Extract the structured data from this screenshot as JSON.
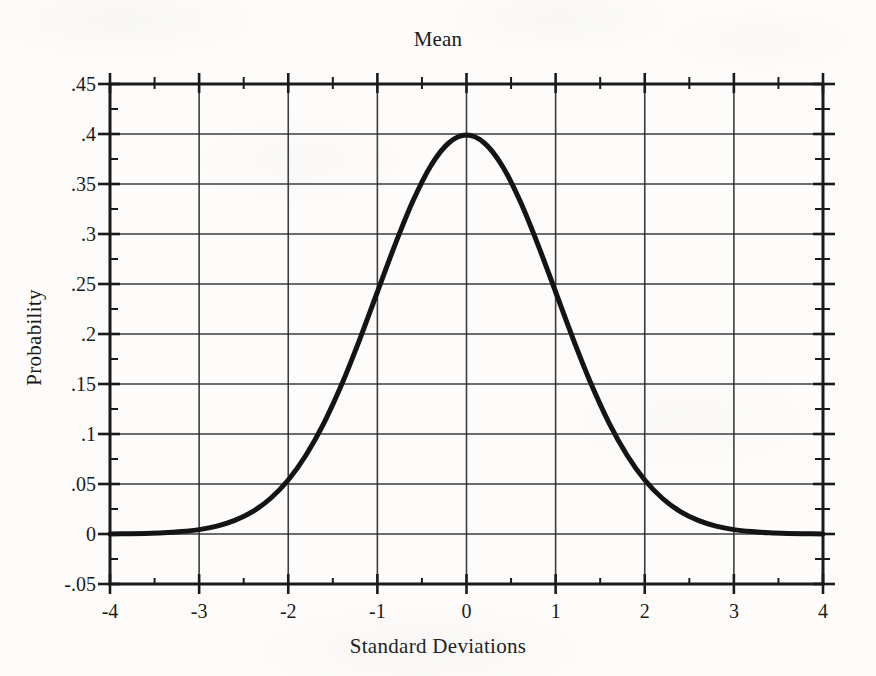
{
  "figure": {
    "background_color": "#fdfcfa",
    "ink_color": "#1a1a1a"
  },
  "chart_data": {
    "type": "line",
    "title": "Mean",
    "subtitle": "",
    "xlabel": "Standard Deviations",
    "ylabel": "Probability",
    "xlim": [
      -4,
      4
    ],
    "ylim": [
      -0.05,
      0.45
    ],
    "grid": true,
    "legend": null,
    "legend_position": "none",
    "x_major_ticks": [
      -4,
      -3,
      -2,
      -1,
      0,
      1,
      2,
      3,
      4
    ],
    "x_tick_labels": [
      "-4",
      "-3",
      "-2",
      "-1",
      "0",
      "1",
      "2",
      "3",
      "4"
    ],
    "x_minor_tick_step": 0.5,
    "y_major_ticks": [
      -0.05,
      0,
      0.05,
      0.1,
      0.15,
      0.2,
      0.25,
      0.3,
      0.35,
      0.4,
      0.45
    ],
    "y_tick_labels": [
      "-.05",
      "0",
      ".05",
      ".1",
      ".15",
      ".2",
      ".25",
      ".3",
      ".35",
      ".4",
      ".45"
    ],
    "y_minor_tick_step": 0.025,
    "series": [
      {
        "name": "Standard Normal Probability Density",
        "color": "#141414",
        "line_width": 5,
        "x": [
          -4,
          -3.8,
          -3.6,
          -3.4,
          -3.2,
          -3,
          -2.8,
          -2.6,
          -2.4,
          -2.2,
          -2,
          -1.8,
          -1.6,
          -1.4,
          -1.2,
          -1,
          -0.8,
          -0.6,
          -0.4,
          -0.2,
          0,
          0.2,
          0.4,
          0.6,
          0.8,
          1,
          1.2,
          1.4,
          1.6,
          1.8,
          2,
          2.2,
          2.4,
          2.6,
          2.8,
          3,
          3.2,
          3.4,
          3.6,
          3.8,
          4
        ],
        "y": [
          0.0001,
          0.0003,
          0.0006,
          0.0012,
          0.0024,
          0.0044,
          0.0079,
          0.0136,
          0.0224,
          0.0355,
          0.054,
          0.079,
          0.1109,
          0.1497,
          0.1942,
          0.242,
          0.2897,
          0.3332,
          0.3683,
          0.391,
          0.3989,
          0.391,
          0.3683,
          0.3332,
          0.2897,
          0.242,
          0.1942,
          0.1497,
          0.1109,
          0.079,
          0.054,
          0.0355,
          0.0224,
          0.0136,
          0.0079,
          0.0044,
          0.0024,
          0.0012,
          0.0006,
          0.0003,
          0.0001
        ]
      }
    ],
    "annotations": [
      {
        "text": "Mean",
        "x": 0,
        "note": "title positioned above the mean (x = 0)"
      }
    ],
    "peak": {
      "x": 0,
      "y": 0.3989
    }
  }
}
